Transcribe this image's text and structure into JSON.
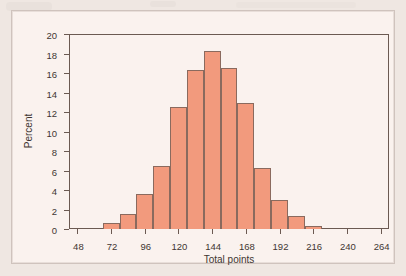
{
  "figure": {
    "background_color": "#faf2ee",
    "page_color": "#efe7e2",
    "bar_fill_color": "#f29a7d",
    "bar_edge_color": "#8a6a5e",
    "axis_color": "#6b5a52"
  },
  "chart_data": {
    "type": "bar",
    "title": "",
    "subtitle": "",
    "xlabel": "Total points",
    "ylabel": "Percent",
    "xlim": [
      42,
      270
    ],
    "ylim": [
      0,
      20
    ],
    "grid": false,
    "legend": null,
    "bin_width": 12,
    "x_ticks": [
      48,
      72,
      96,
      120,
      144,
      168,
      192,
      216,
      240,
      264
    ],
    "y_ticks": [
      0,
      2,
      4,
      6,
      8,
      10,
      12,
      14,
      16,
      18,
      20
    ],
    "x_tick_labels": [
      "48",
      "72",
      "96",
      "120",
      "144",
      "168",
      "192",
      "216",
      "240",
      "264"
    ],
    "y_tick_labels": [
      "0",
      "2",
      "4",
      "6",
      "8",
      "10",
      "12",
      "14",
      "16",
      "18",
      "20"
    ],
    "categories": [
      "66-78",
      "78-90",
      "90-102",
      "102-114",
      "114-126",
      "126-138",
      "138-150",
      "150-162",
      "162-174",
      "174-186",
      "186-198",
      "198-210",
      "210-222"
    ],
    "bins": [
      {
        "start": 66,
        "end": 78,
        "value": 0.6
      },
      {
        "start": 78,
        "end": 90,
        "value": 1.5
      },
      {
        "start": 90,
        "end": 102,
        "value": 3.6
      },
      {
        "start": 102,
        "end": 114,
        "value": 6.5
      },
      {
        "start": 114,
        "end": 126,
        "value": 12.5
      },
      {
        "start": 126,
        "end": 138,
        "value": 16.3
      },
      {
        "start": 138,
        "end": 150,
        "value": 18.3
      },
      {
        "start": 150,
        "end": 162,
        "value": 16.5
      },
      {
        "start": 162,
        "end": 174,
        "value": 12.9
      },
      {
        "start": 174,
        "end": 186,
        "value": 6.3
      },
      {
        "start": 186,
        "end": 198,
        "value": 3.0
      },
      {
        "start": 198,
        "end": 210,
        "value": 1.3
      },
      {
        "start": 210,
        "end": 222,
        "value": 0.3
      }
    ],
    "values": [
      0.6,
      1.5,
      3.6,
      6.5,
      12.5,
      16.3,
      18.3,
      16.5,
      12.9,
      6.3,
      3.0,
      1.3,
      0.3
    ]
  }
}
